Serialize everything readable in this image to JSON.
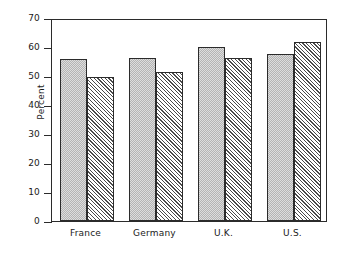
{
  "chart_data": {
    "type": "bar",
    "title": "",
    "xlabel": "",
    "ylabel": "Percent",
    "categories": [
      "France",
      "Germany",
      "U.K.",
      "U.S."
    ],
    "series": [
      {
        "name": "series-1-solid",
        "values": [
          55.7,
          56.3,
          60.0,
          57.6
        ]
      },
      {
        "name": "series-2-hatched",
        "values": [
          49.7,
          51.5,
          56.2,
          61.6
        ]
      }
    ],
    "ylim": [
      0,
      70
    ],
    "yticks": [
      0,
      10,
      20,
      30,
      40,
      50,
      60,
      70
    ],
    "ytick_labels": [
      "0",
      "10",
      "20",
      "30",
      "40",
      "50",
      "60",
      "70"
    ],
    "grid": false,
    "legend": "none",
    "frame": true,
    "colors": {
      "solid_fill": "#b4b4b4",
      "hatch_stroke": "#4a4a4a",
      "axis": "#2b2b2b",
      "text": "#1a1a1a",
      "background": "#ffffff"
    }
  }
}
